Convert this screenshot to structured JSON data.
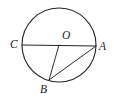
{
  "figure": {
    "kind": "circle-geometry-diagram",
    "background_color": "#ffffff",
    "stroke_color": "#272727",
    "label_color": "#1c1c1c",
    "canvas": {
      "width": 116,
      "height": 103
    },
    "circle": {
      "name": "circle-O",
      "center_x": 59,
      "center_y": 45,
      "radius": 37
    },
    "points": [
      {
        "id": "C",
        "label": "C",
        "x": 22,
        "y": 45,
        "label_x": 10,
        "label_y": 39,
        "description": "left endpoint of diameter on circle"
      },
      {
        "id": "A",
        "label": "A",
        "x": 96,
        "y": 46,
        "label_x": 99,
        "label_y": 41,
        "description": "right endpoint of diameter on circle"
      },
      {
        "id": "O",
        "label": "O",
        "x": 59,
        "y": 45,
        "label_x": 62,
        "label_y": 30,
        "description": "center of the circle"
      },
      {
        "id": "B",
        "label": "B",
        "x": 49,
        "y": 80,
        "label_x": 40,
        "label_y": 84,
        "description": "point on lower-left arc of circle"
      }
    ],
    "segments": [
      {
        "id": "CA",
        "name": "diameter-c-a",
        "from": "C",
        "to": "A",
        "x1": 22,
        "y1": 45,
        "x2": 96,
        "y2": 46
      },
      {
        "id": "OB",
        "name": "radius-o-b",
        "from": "O",
        "to": "B",
        "x1": 59,
        "y1": 45,
        "x2": 49,
        "y2": 80
      },
      {
        "id": "BA",
        "name": "chord-b-a",
        "from": "B",
        "to": "A",
        "x1": 49,
        "y1": 80,
        "x2": 96,
        "y2": 46
      }
    ]
  }
}
